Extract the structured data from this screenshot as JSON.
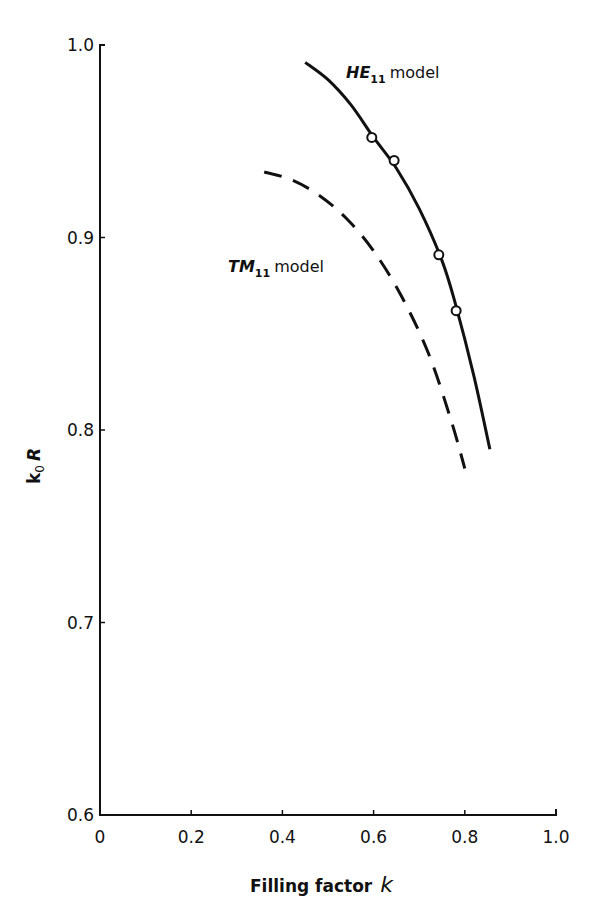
{
  "chart_data": {
    "type": "line",
    "title": "",
    "xlabel": "Filling factor k",
    "xlabel_text": "Filling factor",
    "xlabel_var": "k",
    "ylabel": "k0 R",
    "ylabel_main": "k",
    "ylabel_sub": "0",
    "ylabel_tail": "R",
    "xlim": [
      0,
      1.0
    ],
    "ylim": [
      0.6,
      1.0
    ],
    "x_ticks": [
      0,
      0.2,
      0.4,
      0.6,
      0.8,
      1.0
    ],
    "x_tick_labels": [
      "0",
      "0.2",
      "0.4",
      "0.6",
      "0.8",
      "1.0"
    ],
    "y_ticks": [
      0.6,
      0.7,
      0.8,
      0.9,
      1.0
    ],
    "y_tick_labels": [
      "0.6",
      "0.7",
      "0.8",
      "0.9",
      "1.0"
    ],
    "grid": false,
    "legend": "inline labels",
    "series": [
      {
        "name": "HE11 model",
        "label_main": "HE",
        "label_sub": "11",
        "label_tail": "model",
        "style": "solid",
        "x": [
          0.45,
          0.5,
          0.55,
          0.6,
          0.65,
          0.7,
          0.75,
          0.78,
          0.82,
          0.855
        ],
        "y": [
          0.991,
          0.982,
          0.969,
          0.952,
          0.936,
          0.915,
          0.888,
          0.865,
          0.828,
          0.79
        ]
      },
      {
        "name": "TM11 model",
        "label_main": "TM",
        "label_sub": "11",
        "label_tail": "model",
        "style": "dashed",
        "x": [
          0.36,
          0.42,
          0.48,
          0.54,
          0.6,
          0.66,
          0.72,
          0.77,
          0.8
        ],
        "y": [
          0.934,
          0.93,
          0.922,
          0.91,
          0.893,
          0.87,
          0.84,
          0.805,
          0.78
        ]
      },
      {
        "name": "Measured points",
        "style": "markers",
        "marker": "open-circle",
        "x": [
          0.596,
          0.645,
          0.743,
          0.781
        ],
        "y": [
          0.952,
          0.94,
          0.891,
          0.862
        ]
      }
    ]
  }
}
